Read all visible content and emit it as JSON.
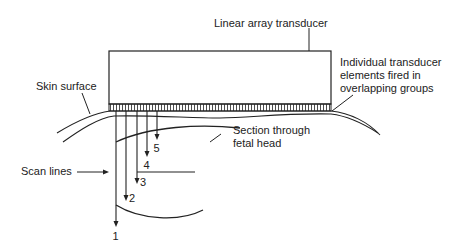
{
  "diagram": {
    "colors": {
      "line": "#222222",
      "background": "#ffffff"
    },
    "labels": {
      "transducer": "Linear array transducer",
      "elements": [
        "Individual transducer",
        "elements fired in",
        "overlapping groups"
      ],
      "skin": "Skin surface",
      "fetal_head": [
        "Section through",
        "fetal head"
      ],
      "scan_lines": "Scan lines"
    },
    "scan_lines": [
      {
        "number": "1",
        "x": 116,
        "y_end": 225
      },
      {
        "number": "2",
        "x": 126,
        "y_end": 199
      },
      {
        "number": "3",
        "x": 137,
        "y_end": 182
      },
      {
        "number": "4",
        "x": 147,
        "y_end": 155
      },
      {
        "number": "5",
        "x": 157,
        "y_end": 138
      }
    ]
  }
}
